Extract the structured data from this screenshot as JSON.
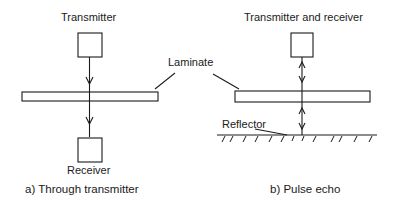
{
  "diagram": {
    "panel_a": {
      "top_label": "Transmitter",
      "bottom_label": "Receiver",
      "caption": "a) Through transmitter"
    },
    "panel_b": {
      "top_label": "Transmitter and receiver",
      "reflector_label": "Reflector",
      "caption": "b) Pulse echo"
    },
    "shared": {
      "laminate_label": "Laminate"
    },
    "colors": {
      "stroke": "#1a1a1a",
      "background": "#ffffff"
    }
  }
}
